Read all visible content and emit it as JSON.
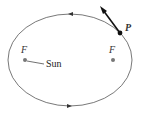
{
  "diagram": {
    "focus_left_label": "F",
    "focus_right_label": "F",
    "sun_label": "Sun",
    "point_label": "P",
    "colors": {
      "orbit": "#555555",
      "focus": "#777777",
      "point": "#111111"
    }
  }
}
